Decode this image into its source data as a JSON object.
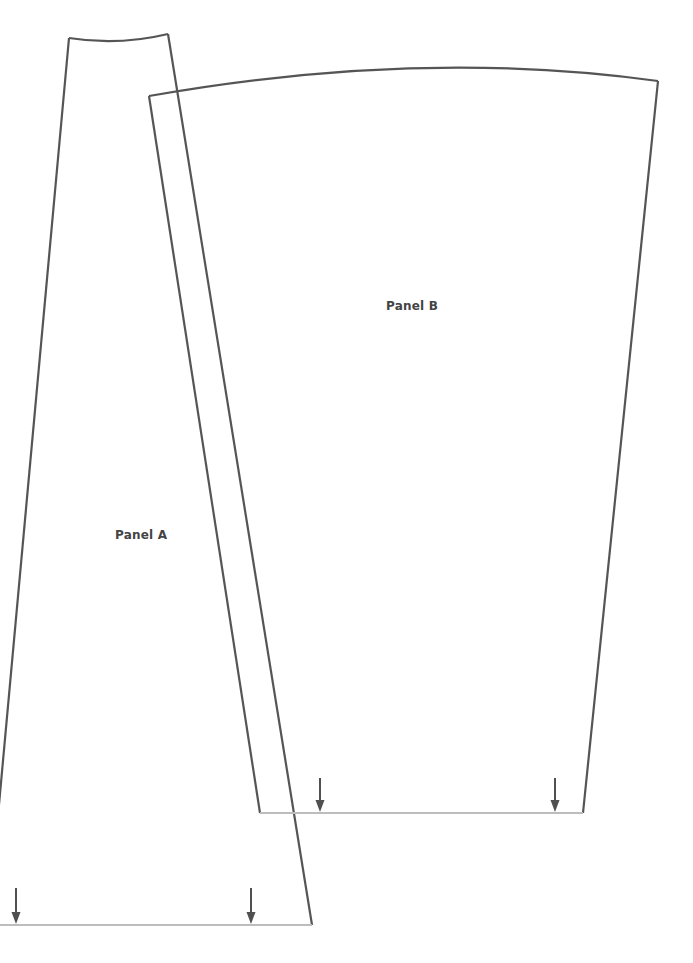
{
  "diagram": {
    "type": "sewing-pattern-pieces",
    "colors": {
      "outline": "#555555",
      "hemline": "#bdbdbd",
      "arrow": "#505050",
      "label": "#444444",
      "background": "#ffffff"
    },
    "panels": [
      {
        "id": "panel-a",
        "label": "Panel A",
        "corners": {
          "top_left": [
            69,
            38
          ],
          "top_right": [
            168,
            34
          ],
          "bottom_right": [
            312,
            925
          ],
          "bottom_left": [
            -12,
            925
          ]
        },
        "hemline_y": 925,
        "grainline_arrows_x": [
          16,
          251
        ]
      },
      {
        "id": "panel-b",
        "label": "Panel B",
        "corners": {
          "top_left": [
            149,
            96
          ],
          "top_right": [
            658,
            81
          ],
          "bottom_right": [
            583,
            813
          ],
          "bottom_left": [
            260,
            813
          ]
        },
        "hemline_y": 813,
        "grainline_arrows_x": [
          320,
          555
        ]
      }
    ]
  }
}
